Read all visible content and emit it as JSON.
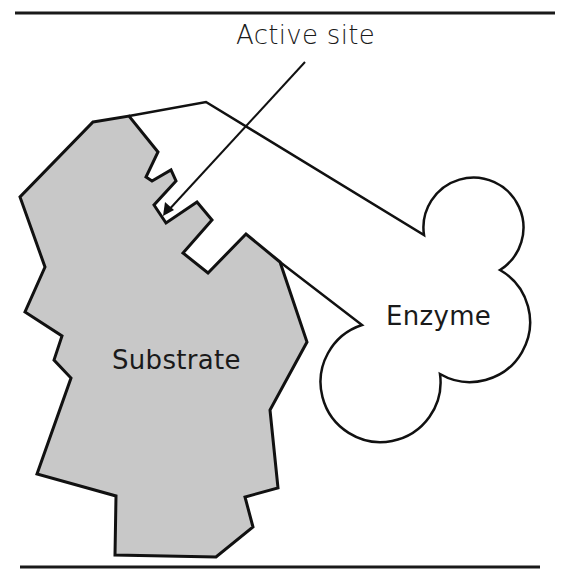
{
  "figure": {
    "type": "lock-and-key enzyme-substrate diagram",
    "labels": {
      "active_site": "Active site",
      "enzyme": "Enzyme",
      "substrate": "Substrate"
    },
    "colors": {
      "substrate_fill": "#c8c8c8",
      "outline": "#111111",
      "enzyme_fill": "#ffffff",
      "rule": "#1a1a1a"
    }
  }
}
